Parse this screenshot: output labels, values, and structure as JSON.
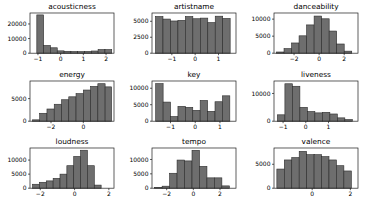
{
  "figure": {
    "background": "#ffffff",
    "bar_fill": "#6e6e6e",
    "bar_edge": "#2b2b2b",
    "axis_color": "#1a1a1a",
    "rows": 3,
    "cols": 3
  },
  "chart_data": [
    {
      "type": "bar",
      "title": "acousticness",
      "xlabel": "",
      "ylabel": "",
      "grid": false,
      "legend": null,
      "xlim": [
        -1.35,
        2.35
      ],
      "ylim": [
        0,
        27500
      ],
      "xticks": [
        -1,
        0,
        1,
        2
      ],
      "xticklabels": [
        "−1",
        "0",
        "1",
        "2"
      ],
      "yticks": [
        0,
        10000,
        20000
      ],
      "yticklabels": [
        "0",
        "10000",
        "20000"
      ],
      "bin_edges": [
        -1.05,
        -0.75,
        -0.45,
        -0.15,
        0.15,
        0.45,
        0.75,
        1.05,
        1.35,
        1.65,
        1.95,
        2.25
      ],
      "values": [
        26200,
        5300,
        3700,
        1600,
        1300,
        1150,
        1100,
        1200,
        1500,
        2500,
        2500
      ]
    },
    {
      "type": "bar",
      "title": "artistname",
      "xlabel": "",
      "ylabel": "",
      "grid": false,
      "legend": null,
      "xlim": [
        -1.85,
        1.75
      ],
      "ylim": [
        0,
        6300
      ],
      "xticks": [
        -1,
        0,
        1
      ],
      "xticklabels": [
        "−1",
        "0",
        "1"
      ],
      "yticks": [
        0,
        2500,
        5000
      ],
      "yticklabels": [
        "0",
        "2500",
        "5000"
      ],
      "bin_edges": [
        -1.7,
        -1.38,
        -1.06,
        -0.74,
        -0.42,
        -0.1,
        0.22,
        0.54,
        0.86,
        1.18,
        1.5
      ],
      "values": [
        5750,
        5350,
        5050,
        5150,
        5750,
        5400,
        5500,
        4800,
        5800,
        5450
      ]
    },
    {
      "type": "bar",
      "title": "danceability",
      "xlabel": "",
      "ylabel": "",
      "grid": false,
      "legend": null,
      "xlim": [
        -3.6,
        3.1
      ],
      "ylim": [
        0,
        11800
      ],
      "xticks": [
        -2,
        0,
        2
      ],
      "xticklabels": [
        "−2",
        "0",
        "2"
      ],
      "yticks": [
        0,
        5000,
        10000
      ],
      "yticklabels": [
        "0",
        "5000",
        "10000"
      ],
      "bin_edges": [
        -3.4,
        -2.8,
        -2.2,
        -1.6,
        -1.0,
        -0.4,
        0.2,
        0.8,
        1.4,
        2.0,
        2.6
      ],
      "values": [
        350,
        1350,
        3000,
        5100,
        8300,
        10900,
        10100,
        6500,
        2700,
        600
      ]
    },
    {
      "type": "bar",
      "title": "energy",
      "xlabel": "",
      "ylabel": "",
      "grid": false,
      "legend": null,
      "xlim": [
        -3.3,
        1.9
      ],
      "ylim": [
        0,
        8900
      ],
      "xticks": [
        -2,
        0
      ],
      "xticklabels": [
        "−2",
        "0"
      ],
      "yticks": [
        0,
        5000
      ],
      "yticklabels": [
        "0",
        "5000"
      ],
      "bin_edges": [
        -3.15,
        -2.7,
        -2.25,
        -1.8,
        -1.35,
        -0.9,
        -0.45,
        0.0,
        0.45,
        0.9,
        1.35,
        1.75
      ],
      "values": [
        300,
        1750,
        2700,
        3750,
        4750,
        5400,
        6100,
        6900,
        7700,
        8300,
        7600
      ]
    },
    {
      "type": "bar",
      "title": "key",
      "xlabel": "",
      "ylabel": "",
      "grid": false,
      "legend": null,
      "xlim": [
        -1.75,
        1.65
      ],
      "ylim": [
        0,
        12200
      ],
      "xticks": [
        -1,
        0,
        1
      ],
      "xticklabels": [
        "−1",
        "0",
        "1"
      ],
      "yticks": [
        0,
        5000,
        10000
      ],
      "yticklabels": [
        "0",
        "5000",
        "10000"
      ],
      "bin_edges": [
        -1.6,
        -1.3,
        -1.0,
        -0.7,
        -0.4,
        -0.1,
        0.2,
        0.5,
        0.8,
        1.1,
        1.4
      ],
      "values": [
        11400,
        5800,
        1400,
        4500,
        4200,
        3300,
        6300,
        3000,
        5900,
        7700
      ]
    },
    {
      "type": "bar",
      "title": "liveness",
      "xlabel": "",
      "ylabel": "",
      "grid": false,
      "legend": null,
      "xlim": [
        -1.4,
        2.3
      ],
      "ylim": [
        0,
        14500
      ],
      "xticks": [
        -1,
        0,
        1
      ],
      "xticklabels": [
        "−1",
        "0",
        "1"
      ],
      "yticks": [
        0,
        10000
      ],
      "yticklabels": [
        "0",
        "10000"
      ],
      "bin_edges": [
        -1.25,
        -0.92,
        -0.59,
        -0.26,
        0.07,
        0.4,
        0.73,
        1.06,
        1.39,
        1.72,
        2.05
      ],
      "values": [
        2300,
        13500,
        12600,
        5000,
        3500,
        3000,
        3200,
        2600,
        1200,
        600
      ]
    },
    {
      "type": "bar",
      "title": "loudness",
      "xlabel": "",
      "ylabel": "",
      "grid": false,
      "legend": null,
      "xlim": [
        -2.6,
        2.3
      ],
      "ylim": [
        0,
        14300
      ],
      "xticks": [
        -2,
        0,
        2
      ],
      "xticklabels": [
        "−2",
        "0",
        "2"
      ],
      "yticks": [
        0,
        5000,
        10000
      ],
      "yticklabels": [
        "0",
        "5000",
        "10000"
      ],
      "bin_edges": [
        -2.45,
        -2.05,
        -1.65,
        -1.25,
        -0.85,
        -0.45,
        -0.05,
        0.35,
        0.75,
        1.15,
        1.55
      ],
      "values": [
        1400,
        2100,
        2600,
        3500,
        5000,
        8000,
        11300,
        13500,
        8000,
        1100
      ]
    },
    {
      "type": "bar",
      "title": "tempo",
      "xlabel": "",
      "ylabel": "",
      "grid": false,
      "legend": null,
      "xlim": [
        -3.1,
        3.2
      ],
      "ylim": [
        0,
        14000
      ],
      "xticks": [
        -2,
        0,
        2
      ],
      "xticklabels": [
        "−2",
        "0",
        "2"
      ],
      "yticks": [
        0,
        5000,
        10000
      ],
      "yticklabels": [
        "0",
        "5000",
        "10000"
      ],
      "bin_edges": [
        -2.9,
        -2.34,
        -1.78,
        -1.22,
        -0.66,
        -0.1,
        0.46,
        1.02,
        1.58,
        2.14,
        2.7
      ],
      "values": [
        300,
        700,
        5200,
        9800,
        9500,
        13200,
        7600,
        3600,
        3600,
        800
      ]
    },
    {
      "type": "bar",
      "title": "valence",
      "xlabel": "",
      "ylabel": "",
      "grid": false,
      "legend": null,
      "xlim": [
        -2.0,
        2.4
      ],
      "ylim": [
        0,
        8400
      ],
      "xticks": [
        0,
        2
      ],
      "xticklabels": [
        "0",
        "2"
      ],
      "yticks": [
        0,
        5000
      ],
      "yticklabels": [
        "0",
        "5000"
      ],
      "bin_edges": [
        -1.85,
        -1.46,
        -1.07,
        -0.68,
        -0.29,
        0.1,
        0.49,
        0.88,
        1.27,
        1.66,
        2.05
      ],
      "values": [
        4000,
        5900,
        6400,
        7700,
        7000,
        7000,
        6600,
        5900,
        4700,
        3600
      ]
    }
  ]
}
